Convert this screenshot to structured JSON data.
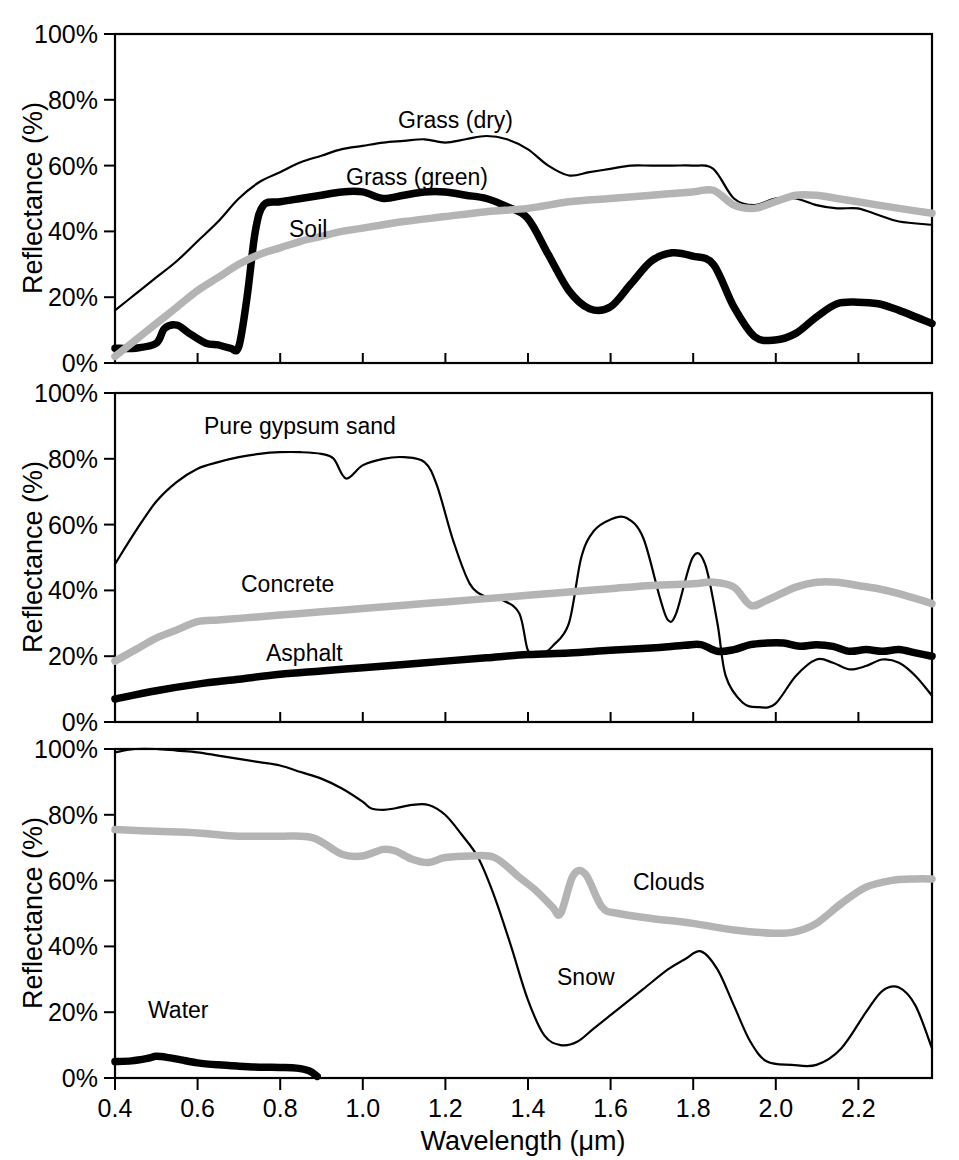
{
  "figure": {
    "axis_titles": {
      "x": "Wavelength (μm)",
      "y": "Reflectance (%)"
    },
    "y_ticks": [
      "0%",
      "20%",
      "40%",
      "60%",
      "80%",
      "100%"
    ],
    "x_ticks": [
      "0.4",
      "0.6",
      "0.8",
      "1.0",
      "1.2",
      "1.4",
      "1.6",
      "1.8",
      "2.0",
      "2.2"
    ],
    "labels": {
      "grass_dry": "Grass (dry)",
      "grass_green": "Grass (green)",
      "soil": "Soil",
      "gypsum": "Pure gypsum sand",
      "concrete": "Concrete",
      "asphalt": "Asphalt",
      "clouds": "Clouds",
      "snow": "Snow",
      "water": "Water"
    },
    "colors": {
      "black": "#000000",
      "gray": "#b4b4b4",
      "background": "#ffffff"
    }
  },
  "chart_data": [
    {
      "type": "line",
      "panel": 1,
      "title": "",
      "xlabel": "Wavelength (μm)",
      "ylabel": "Reflectance (%)",
      "xlim": [
        0.4,
        2.38
      ],
      "ylim": [
        0,
        100
      ],
      "grid": false,
      "legend": "inline-annotations",
      "series": [
        {
          "name": "Grass (dry)",
          "style": "thin-black",
          "x": [
            0.4,
            0.45,
            0.5,
            0.55,
            0.6,
            0.65,
            0.7,
            0.75,
            0.8,
            0.85,
            0.9,
            0.95,
            1.0,
            1.05,
            1.1,
            1.15,
            1.2,
            1.25,
            1.3,
            1.35,
            1.4,
            1.45,
            1.5,
            1.55,
            1.6,
            1.65,
            1.7,
            1.75,
            1.8,
            1.85,
            1.9,
            1.95,
            2.0,
            2.05,
            2.1,
            2.15,
            2.2,
            2.25,
            2.3,
            2.38
          ],
          "y": [
            16,
            21,
            26,
            31,
            37,
            43,
            50,
            55,
            58,
            61,
            63,
            65,
            66,
            67,
            67.5,
            68,
            67,
            68,
            69,
            68,
            65,
            60,
            57,
            58,
            59,
            60,
            60,
            60,
            60,
            59,
            50,
            48,
            50,
            50,
            48,
            47,
            47,
            45,
            43,
            42
          ]
        },
        {
          "name": "Grass (green)",
          "style": "thick-black",
          "x": [
            0.4,
            0.45,
            0.5,
            0.52,
            0.55,
            0.58,
            0.62,
            0.65,
            0.68,
            0.7,
            0.72,
            0.74,
            0.76,
            0.8,
            0.85,
            0.9,
            0.95,
            1.0,
            1.05,
            1.1,
            1.15,
            1.2,
            1.25,
            1.3,
            1.35,
            1.4,
            1.45,
            1.5,
            1.55,
            1.6,
            1.65,
            1.7,
            1.75,
            1.8,
            1.85,
            1.9,
            1.95,
            2.0,
            2.05,
            2.1,
            2.15,
            2.2,
            2.25,
            2.3,
            2.38
          ],
          "y": [
            4.5,
            4.5,
            6,
            10.5,
            11.5,
            9,
            6,
            5.5,
            4.5,
            5,
            20,
            40,
            48,
            49,
            50,
            51,
            52,
            52,
            50,
            51,
            52,
            52,
            51,
            50,
            47.5,
            44,
            33,
            22,
            16.5,
            17,
            24,
            31,
            33.5,
            32.5,
            30,
            17,
            8,
            7,
            9,
            14,
            18,
            18.5,
            18,
            16,
            12
          ]
        },
        {
          "name": "Soil",
          "style": "thick-gray",
          "x": [
            0.4,
            0.45,
            0.5,
            0.55,
            0.6,
            0.65,
            0.7,
            0.75,
            0.8,
            0.85,
            0.9,
            0.95,
            1.0,
            1.05,
            1.1,
            1.2,
            1.3,
            1.4,
            1.5,
            1.6,
            1.7,
            1.8,
            1.85,
            1.9,
            1.95,
            2.0,
            2.05,
            2.1,
            2.15,
            2.2,
            2.25,
            2.3,
            2.38
          ],
          "y": [
            2,
            7,
            12,
            17,
            22,
            26,
            30,
            33,
            35,
            37,
            38.5,
            40,
            41,
            42,
            43,
            44.5,
            46,
            47,
            49,
            50,
            51,
            52,
            52.5,
            48,
            47,
            49,
            51,
            51,
            50,
            49,
            48,
            47,
            45.5
          ]
        }
      ]
    },
    {
      "type": "line",
      "panel": 2,
      "title": "",
      "xlabel": "Wavelength (μm)",
      "ylabel": "Reflectance (%)",
      "xlim": [
        0.4,
        2.38
      ],
      "ylim": [
        0,
        100
      ],
      "grid": false,
      "legend": "inline-annotations",
      "series": [
        {
          "name": "Pure gypsum sand",
          "style": "thin-black",
          "x": [
            0.4,
            0.45,
            0.5,
            0.55,
            0.6,
            0.65,
            0.7,
            0.75,
            0.8,
            0.85,
            0.9,
            0.93,
            0.96,
            1.0,
            1.05,
            1.1,
            1.15,
            1.18,
            1.22,
            1.26,
            1.3,
            1.34,
            1.38,
            1.4,
            1.42,
            1.44,
            1.46,
            1.5,
            1.53,
            1.56,
            1.6,
            1.64,
            1.68,
            1.72,
            1.74,
            1.76,
            1.8,
            1.83,
            1.86,
            1.88,
            1.92,
            1.96,
            2.0,
            2.05,
            2.1,
            2.14,
            2.18,
            2.22,
            2.26,
            2.3,
            2.34,
            2.38
          ],
          "y": [
            48,
            58,
            67,
            73,
            77,
            79,
            80.5,
            81.5,
            82,
            82,
            81.5,
            80,
            74,
            78,
            80,
            80.5,
            79,
            72,
            55,
            42,
            38,
            37,
            33,
            22,
            20.5,
            21,
            23,
            30,
            50,
            58,
            61.5,
            62,
            56,
            38,
            31,
            33,
            50,
            48,
            30,
            14,
            6,
            4.5,
            5.5,
            14,
            19,
            18,
            16,
            17,
            19,
            18,
            14,
            8
          ]
        },
        {
          "name": "Concrete",
          "style": "thick-gray",
          "x": [
            0.4,
            0.45,
            0.5,
            0.55,
            0.6,
            0.65,
            0.7,
            0.8,
            0.9,
            1.0,
            1.1,
            1.2,
            1.3,
            1.4,
            1.5,
            1.6,
            1.7,
            1.8,
            1.85,
            1.9,
            1.94,
            1.98,
            2.05,
            2.1,
            2.15,
            2.2,
            2.25,
            2.3,
            2.38
          ],
          "y": [
            18.5,
            22,
            25.5,
            28,
            30.5,
            31,
            31.5,
            32.5,
            33.5,
            34.5,
            35.5,
            36.5,
            37.5,
            38.5,
            39.5,
            40.5,
            41.5,
            42,
            42.5,
            41,
            35.5,
            37,
            41,
            42.5,
            42.5,
            41.5,
            40.5,
            39,
            36
          ]
        },
        {
          "name": "Asphalt",
          "style": "thick-black",
          "x": [
            0.4,
            0.5,
            0.6,
            0.7,
            0.8,
            0.9,
            1.0,
            1.1,
            1.2,
            1.3,
            1.4,
            1.5,
            1.6,
            1.7,
            1.78,
            1.82,
            1.86,
            1.9,
            1.94,
            1.98,
            2.02,
            2.06,
            2.1,
            2.14,
            2.18,
            2.22,
            2.26,
            2.3,
            2.34,
            2.38
          ],
          "y": [
            7,
            9.5,
            11.5,
            13,
            14.5,
            15.5,
            16.5,
            17.5,
            18.5,
            19.5,
            20.5,
            21,
            21.8,
            22.5,
            23.3,
            23.5,
            21.5,
            22,
            23.5,
            24,
            24,
            23,
            23.5,
            23,
            21.5,
            22,
            21.5,
            22,
            21,
            20
          ]
        }
      ]
    },
    {
      "type": "line",
      "panel": 3,
      "title": "",
      "xlabel": "Wavelength (μm)",
      "ylabel": "Reflectance (%)",
      "xlim": [
        0.4,
        2.38
      ],
      "ylim": [
        0,
        100
      ],
      "grid": false,
      "legend": "inline-annotations",
      "series": [
        {
          "name": "Snow",
          "style": "thin-black",
          "x": [
            0.4,
            0.45,
            0.5,
            0.55,
            0.6,
            0.65,
            0.7,
            0.75,
            0.8,
            0.85,
            0.9,
            0.95,
            1.0,
            1.02,
            1.05,
            1.08,
            1.12,
            1.16,
            1.2,
            1.24,
            1.28,
            1.32,
            1.36,
            1.4,
            1.44,
            1.48,
            1.52,
            1.56,
            1.62,
            1.68,
            1.74,
            1.78,
            1.82,
            1.86,
            1.9,
            1.94,
            1.98,
            2.04,
            2.1,
            2.16,
            2.22,
            2.26,
            2.3,
            2.34,
            2.38
          ],
          "y": [
            99,
            100,
            100,
            99.5,
            99,
            98,
            97,
            96,
            95,
            93,
            91,
            88,
            84,
            82,
            81.5,
            82,
            83,
            83,
            80,
            74,
            67,
            55,
            40,
            24,
            13,
            10,
            11,
            15,
            21,
            27,
            33,
            36,
            38.5,
            33,
            22,
            11,
            5,
            4,
            4,
            9,
            20,
            26.5,
            27.5,
            22,
            9
          ]
        },
        {
          "name": "Clouds",
          "style": "thick-gray",
          "x": [
            0.4,
            0.5,
            0.6,
            0.7,
            0.8,
            0.88,
            0.95,
            1.0,
            1.05,
            1.08,
            1.12,
            1.16,
            1.2,
            1.26,
            1.32,
            1.38,
            1.42,
            1.46,
            1.48,
            1.51,
            1.54,
            1.58,
            1.62,
            1.7,
            1.8,
            1.9,
            2.0,
            2.05,
            2.1,
            2.16,
            2.22,
            2.28,
            2.34,
            2.38
          ],
          "y": [
            75.5,
            75,
            74.5,
            73.5,
            73.5,
            73,
            68,
            67.5,
            69.5,
            69,
            66.5,
            65.5,
            67,
            67.5,
            67,
            61,
            57,
            52,
            50,
            61.5,
            62,
            52,
            50,
            48.5,
            47,
            45,
            44,
            44.5,
            47,
            53,
            58,
            60,
            60.5,
            60.5
          ]
        },
        {
          "name": "Water",
          "style": "thick-black",
          "x": [
            0.4,
            0.44,
            0.48,
            0.5,
            0.53,
            0.56,
            0.6,
            0.65,
            0.7,
            0.75,
            0.8,
            0.84,
            0.87,
            0.89
          ],
          "y": [
            5,
            5.2,
            6,
            6.6,
            6.2,
            5.5,
            4.6,
            4.0,
            3.6,
            3.3,
            3.2,
            3.0,
            2.2,
            0.5
          ]
        }
      ]
    }
  ]
}
